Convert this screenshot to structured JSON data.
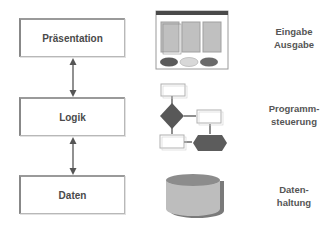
{
  "layers": [
    {
      "label": "Präsentation",
      "description_lines": [
        "Eingabe",
        "Ausgabe"
      ]
    },
    {
      "label": "Logik",
      "description_lines": [
        "Programm-",
        "steuerung"
      ]
    },
    {
      "label": "Daten",
      "description_lines": [
        "Daten-",
        "haltung"
      ]
    }
  ],
  "icons": {
    "presentation": "window-form-icon",
    "logic": "flowchart-icon",
    "data": "database-cylinder-icon"
  },
  "colors": {
    "box_border": "#888888",
    "label_text": "#4a4a4a",
    "dark_shape": "#5a5a5a",
    "light_shape": "#c8c8c8",
    "arrow": "#555555"
  }
}
